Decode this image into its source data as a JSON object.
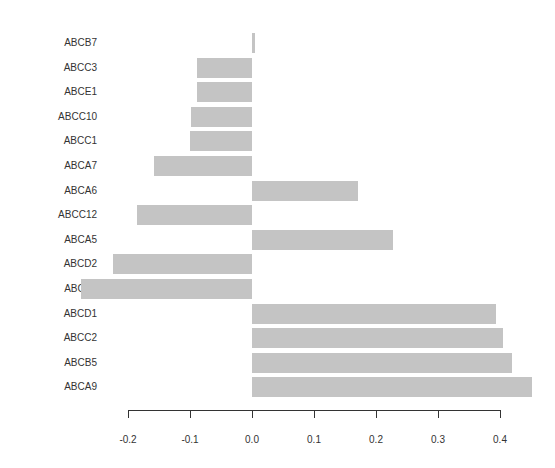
{
  "chart_data": {
    "type": "bar",
    "orientation": "horizontal",
    "title": "",
    "xlabel": "",
    "ylabel": "",
    "categories": [
      "ABCB7",
      "ABCC3",
      "ABCE1",
      "ABCC10",
      "ABCC1",
      "ABCA7",
      "ABCA6",
      "ABCC12",
      "ABCA5",
      "ABCD2",
      "ABCA3",
      "ABCD1",
      "ABCC2",
      "ABCB5",
      "ABCA9"
    ],
    "values": [
      0.005,
      -0.088,
      -0.088,
      -0.098,
      -0.1,
      -0.158,
      0.171,
      -0.186,
      0.227,
      -0.224,
      -0.276,
      0.394,
      0.405,
      0.419,
      0.452
    ],
    "xticks": [
      "-0.2",
      "-0.1",
      "0.0",
      "0.1",
      "0.2",
      "0.3",
      "0.4"
    ],
    "xlim": [
      -0.28,
      0.46
    ],
    "grid": false,
    "legend": null,
    "bar_color": "#c4c4c4"
  }
}
